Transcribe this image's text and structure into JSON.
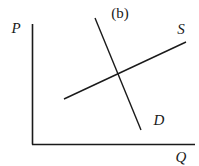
{
  "panel_label": "(b)",
  "axes": {
    "y_label": "P",
    "x_label": "Q"
  },
  "curves": {
    "supply": {
      "label": "S",
      "from": [
        64,
        99
      ],
      "to": [
        186,
        42
      ]
    },
    "demand": {
      "label": "D",
      "from": [
        95,
        18
      ],
      "to": [
        141,
        130
      ]
    }
  },
  "colors": {
    "line": "#1a1a1a",
    "background": "#ffffff"
  }
}
